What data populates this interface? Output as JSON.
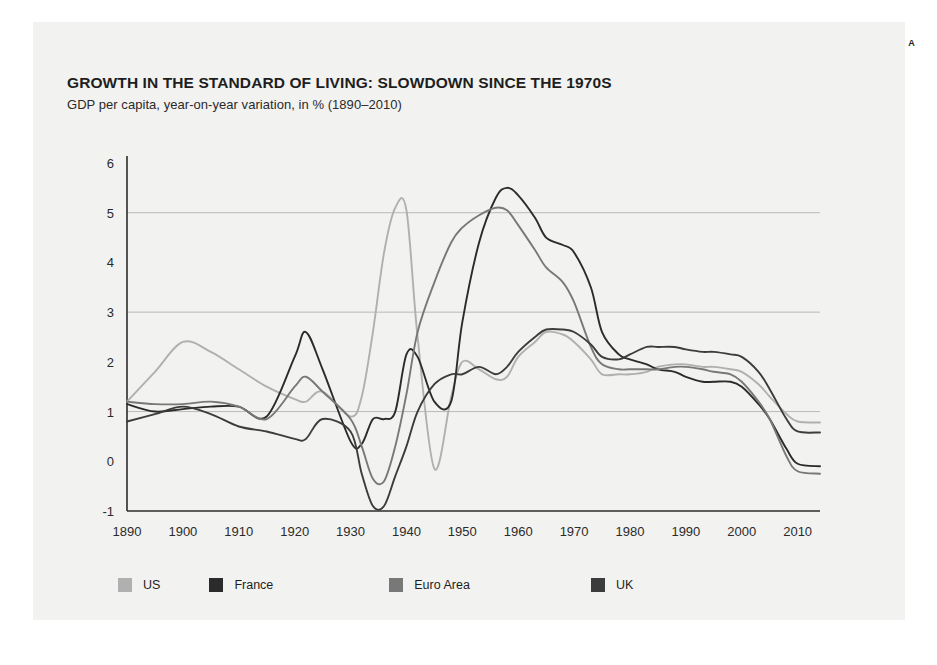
{
  "figure": {
    "corner_label": "A",
    "background_color": "#f2f2f0"
  },
  "chart_data": {
    "type": "line",
    "title": "GROWTH IN THE STANDARD OF LIVING: SLOWDOWN SINCE THE 1970S",
    "subtitle": "GDP per capita, year-on-year variation, in % (1890–2010)",
    "xlabel": "",
    "ylabel": "",
    "xlim": [
      1890,
      2014
    ],
    "ylim": [
      -1,
      6
    ],
    "yticks": [
      "6",
      "5",
      "4",
      "3",
      "2",
      "1",
      "0",
      "-1"
    ],
    "ytick_values": [
      6,
      5,
      4,
      3,
      2,
      1,
      0,
      -1
    ],
    "xticks": [
      "1890",
      "1900",
      "1910",
      "1920",
      "1930",
      "1940",
      "1950",
      "1960",
      "1970",
      "1980",
      "1990",
      "2000",
      "2010"
    ],
    "xtick_values": [
      1890,
      1900,
      1910,
      1920,
      1930,
      1940,
      1950,
      1960,
      1970,
      1980,
      1990,
      2000,
      2010
    ],
    "gridlines": [
      1,
      3,
      5
    ],
    "grid": true,
    "legend_position": "bottom-left",
    "x": [
      1890,
      1895,
      1900,
      1905,
      1910,
      1915,
      1920,
      1922,
      1925,
      1930,
      1932,
      1934,
      1936,
      1938,
      1940,
      1942,
      1945,
      1948,
      1950,
      1953,
      1956,
      1958,
      1960,
      1963,
      1965,
      1968,
      1970,
      1973,
      1975,
      1978,
      1980,
      1983,
      1985,
      1988,
      1990,
      1993,
      1995,
      1998,
      2000,
      2003,
      2005,
      2008,
      2010,
      2014
    ],
    "series": [
      {
        "name": "US",
        "color": "#b0b0b0",
        "values": [
          1.2,
          1.8,
          2.4,
          2.2,
          1.85,
          1.5,
          1.25,
          1.2,
          1.4,
          0.9,
          1.3,
          2.6,
          4.2,
          5.1,
          5.05,
          2.5,
          -0.15,
          1.3,
          2.0,
          1.85,
          1.65,
          1.7,
          2.1,
          2.4,
          2.6,
          2.55,
          2.4,
          2.05,
          1.75,
          1.75,
          1.75,
          1.8,
          1.9,
          1.95,
          1.95,
          1.9,
          1.9,
          1.85,
          1.8,
          1.55,
          1.3,
          0.95,
          0.8,
          0.78
        ]
      },
      {
        "name": "France",
        "color": "#2b2b2b",
        "values": [
          1.15,
          1.0,
          1.05,
          1.1,
          1.1,
          0.9,
          2.1,
          2.6,
          1.85,
          0.4,
          0.35,
          0.85,
          0.85,
          1.0,
          2.15,
          2.1,
          1.2,
          1.2,
          2.8,
          4.4,
          5.3,
          5.5,
          5.35,
          4.9,
          4.5,
          4.35,
          4.2,
          3.5,
          2.6,
          2.15,
          2.05,
          1.95,
          1.85,
          1.8,
          1.7,
          1.6,
          1.6,
          1.6,
          1.5,
          1.15,
          0.85,
          0.25,
          -0.05,
          -0.1
        ]
      },
      {
        "name": "Euro Area",
        "color": "#787878",
        "values": [
          1.2,
          1.15,
          1.15,
          1.2,
          1.1,
          0.85,
          1.5,
          1.7,
          1.4,
          0.85,
          0.3,
          -0.35,
          -0.4,
          0.3,
          1.35,
          2.6,
          3.6,
          4.4,
          4.7,
          4.95,
          5.1,
          5.05,
          4.75,
          4.25,
          3.9,
          3.6,
          3.2,
          2.3,
          1.95,
          1.85,
          1.85,
          1.85,
          1.85,
          1.9,
          1.9,
          1.85,
          1.8,
          1.75,
          1.6,
          1.2,
          0.85,
          0.1,
          -0.2,
          -0.25
        ]
      },
      {
        "name": "UK",
        "color": "#3c3c3c",
        "values": [
          0.8,
          0.95,
          1.1,
          0.95,
          0.7,
          0.6,
          0.45,
          0.45,
          0.85,
          0.6,
          -0.25,
          -0.9,
          -0.9,
          -0.3,
          0.3,
          1.0,
          1.55,
          1.75,
          1.75,
          1.9,
          1.75,
          1.9,
          2.2,
          2.5,
          2.65,
          2.65,
          2.6,
          2.35,
          2.1,
          2.05,
          2.15,
          2.3,
          2.3,
          2.3,
          2.25,
          2.2,
          2.2,
          2.15,
          2.1,
          1.8,
          1.45,
          0.85,
          0.6,
          0.58
        ]
      }
    ]
  },
  "legend": {
    "items": [
      {
        "label": "US",
        "color": "#b0b0b0"
      },
      {
        "label": "France",
        "color": "#2b2b2b"
      },
      {
        "label": "Euro Area",
        "color": "#787878"
      },
      {
        "label": "UK",
        "color": "#3c3c3c"
      }
    ]
  }
}
